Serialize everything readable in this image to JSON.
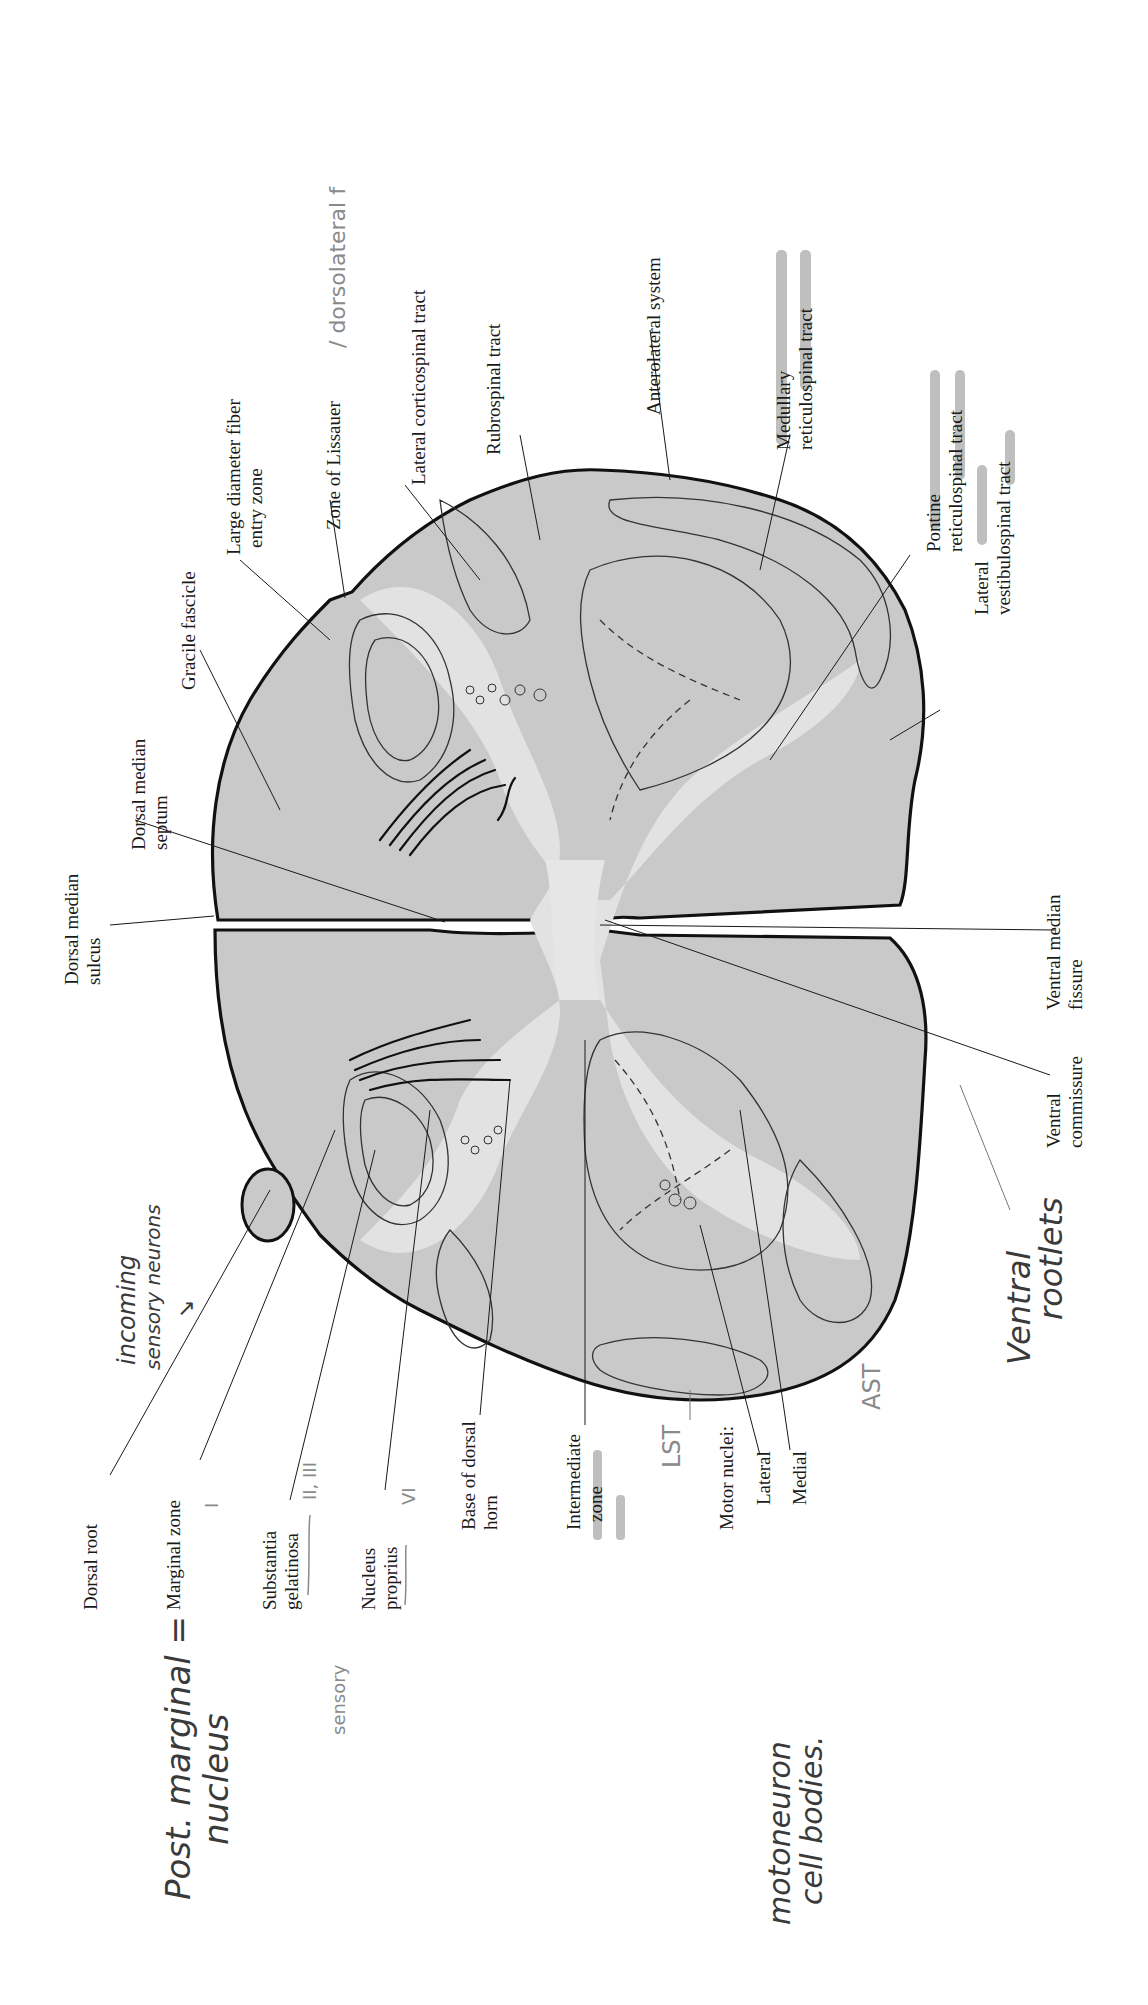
{
  "diagram": {
    "orientation": "rotated 90 degrees counter-clockwise",
    "printed_labels": {
      "dorsal_median_sulcus": [
        "Dorsal median",
        "sulcus"
      ],
      "dorsal_median_septum": [
        "Dorsal median",
        "septum"
      ],
      "gracile_fascicle": "Gracile fascicle",
      "large_diameter_fiber_entry_zone": [
        "Large diameter fiber",
        "entry zone"
      ],
      "zone_of_lissauer": "Zone of Lissauer",
      "lateral_corticospinal_tract": "Lateral corticospinal tract",
      "rubrospinal_tract": "Rubrospinal tract",
      "anterolateral_system": "Anterolateral system",
      "medullary_reticulospinal_tract": [
        "Medullary",
        "reticulospinal tract"
      ],
      "pontine_reticulospinal_tract": [
        "Pontine",
        "reticulospinal tract"
      ],
      "lateral_vestibulospinal_tract": [
        "Lateral",
        "vestibulospinal tract"
      ],
      "ventral_median_fissure": [
        "Ventral median",
        "fissure"
      ],
      "ventral_commissure": [
        "Ventral",
        "commissure"
      ],
      "dorsal_root": "Dorsal root",
      "marginal_zone": "Marginal zone",
      "substantia_gelatinosa": [
        "Substantia",
        "gelatinosa"
      ],
      "nucleus_proprius": [
        "Nucleus",
        "proprius"
      ],
      "base_of_dorsal_horn": [
        "Base of dorsal",
        "horn"
      ],
      "intermediate_zone": [
        "Intermediate",
        "zone"
      ],
      "motor_nuclei": "Motor nuclei:",
      "motor_lateral": "Lateral",
      "motor_medial": "Medial"
    },
    "handwritten_annotations": {
      "dorsolateral": "/ dorsolateral f",
      "incoming_sensory": [
        "incoming",
        "sensory neurons"
      ],
      "marginal_lamina": "I",
      "gelatinosa_lamina": "II, III",
      "proprius_lamina": "VI",
      "post_marginal": [
        "Post. marginal =",
        "nucleus"
      ],
      "sensory": "sensory",
      "lst": "LST",
      "ast": "AST",
      "motoneuron": [
        "motoneuron",
        "cell bodies."
      ],
      "ventral_rootlets": [
        "Ventral",
        "rootlets"
      ]
    },
    "highlighted_labels": [
      "Medullary reticulospinal tract",
      "Pontine reticulospinal tract",
      "Lateral vestibulospinal tract",
      "Intermediate zone"
    ],
    "colors": {
      "white_matter": "#c9c9c9",
      "gray_matter": "#d6d6d6",
      "outline": "#111111",
      "highlighter": "#a9a9a9",
      "pencil": "#8a8a8a"
    }
  }
}
